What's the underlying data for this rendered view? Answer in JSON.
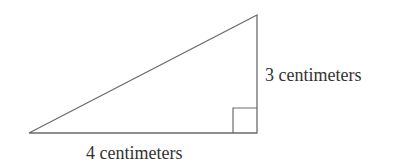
{
  "diagram": {
    "type": "right-triangle",
    "line_color": "#6b6b6b",
    "text_color": "#333333",
    "vertices": {
      "left": [
        29,
        133
      ],
      "right_angle": [
        257,
        133
      ],
      "top": [
        257,
        15
      ]
    },
    "right_angle_marker": {
      "x": 233,
      "y": 108,
      "size": 24
    },
    "labels": {
      "vertical_side": "3 centimeters",
      "base": "4 centimeters"
    }
  }
}
